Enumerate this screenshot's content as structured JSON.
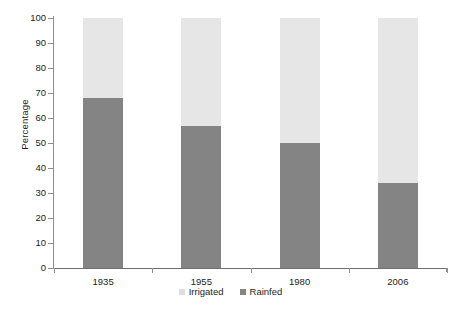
{
  "chart_data": {
    "type": "bar",
    "stacked": true,
    "title": "",
    "xlabel": "",
    "ylabel": "Percentage",
    "categories": [
      "1935",
      "1955",
      "1980",
      "2006"
    ],
    "series": [
      {
        "name": "Irrigated",
        "color": "#e6e6e6",
        "values": [
          32,
          43,
          50,
          66
        ]
      },
      {
        "name": "Rainfed",
        "color": "#848484",
        "values": [
          68,
          57,
          50,
          34
        ]
      }
    ],
    "ylim": [
      0,
      100
    ],
    "yticks": [
      0,
      10,
      20,
      30,
      40,
      50,
      60,
      70,
      80,
      90,
      100
    ],
    "ytick_labels": [
      "0",
      "10",
      "20",
      "30",
      "40",
      "50",
      "60",
      "70",
      "80",
      "90",
      "100"
    ],
    "grid": false,
    "legend_position": "bottom-center",
    "legend_entries": [
      "Irrigated",
      "Rainfed"
    ]
  },
  "axis": {
    "y_title": "Percentage"
  }
}
